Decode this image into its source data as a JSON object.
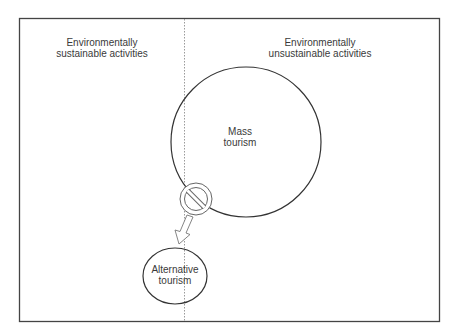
{
  "diagram": {
    "regions": {
      "left": {
        "label_line1": "Environmentally",
        "label_line2": "sustainable activities"
      },
      "right": {
        "label_line1": "Environmentally",
        "label_line2": "unsustainable activities"
      }
    },
    "nodes": {
      "mass": {
        "label_line1": "Mass",
        "label_line2": "tourism"
      },
      "alternative": {
        "label_line1": "Alternative",
        "label_line2": "tourism"
      }
    },
    "icons": {
      "prohibition": "no-entry-icon",
      "arrow": "arrow-down-left-icon"
    },
    "colors": {
      "stroke": "#333333",
      "divider": "#9a9a9a",
      "text": "#3a3a3a",
      "background": "#ffffff"
    }
  }
}
